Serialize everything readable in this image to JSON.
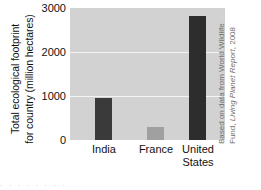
{
  "chart_data": {
    "type": "bar",
    "title": "",
    "xlabel": "",
    "ylabel_line1": "Total ecological footprint",
    "ylabel_line2": "for country (million hectares)",
    "categories": [
      "India",
      "France",
      "United States"
    ],
    "category_lines": [
      {
        "line1": "India",
        "line2": ""
      },
      {
        "line1": "France",
        "line2": ""
      },
      {
        "line1": "United",
        "line2": "States"
      }
    ],
    "values": [
      955,
      290,
      2820
    ],
    "value_unit": "million hectares",
    "ylim": [
      0,
      3000
    ],
    "yticks": [
      0,
      1000,
      2000,
      3000
    ],
    "ytick_labels": [
      "0",
      "1000",
      "2000",
      "3000"
    ],
    "grid": true,
    "grid_orientation": "horizontal",
    "legend": "none",
    "bar_colors": [
      "#3a3a3a",
      "#a0a0a0",
      "#2d2d2d"
    ],
    "plot_background": "#d2d2d2",
    "gridline_color": "#f4f4f4",
    "figure_background": "#ffffff"
  },
  "credit": {
    "line1": "Based on data from World Wildlife",
    "line2_prefix": "Fund, ",
    "line2_italic": "Living Planet Report",
    "line2_suffix": ", 2008"
  },
  "bleed": {
    "text": "·  ·   ·    ·  ·   ·    ·   ·"
  }
}
